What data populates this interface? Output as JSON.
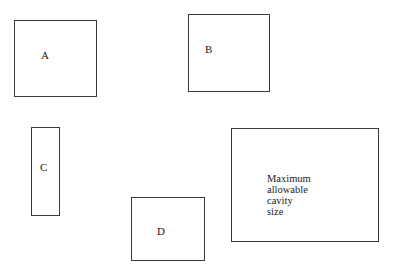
{
  "diagram": {
    "boxes": [
      {
        "id": "A",
        "label": "A"
      },
      {
        "id": "B",
        "label": "B"
      },
      {
        "id": "C",
        "label": "C"
      },
      {
        "id": "D",
        "label": "D"
      }
    ],
    "max_cavity": {
      "lines": [
        "Maximum",
        "allowable",
        "cavity",
        "size"
      ]
    }
  }
}
